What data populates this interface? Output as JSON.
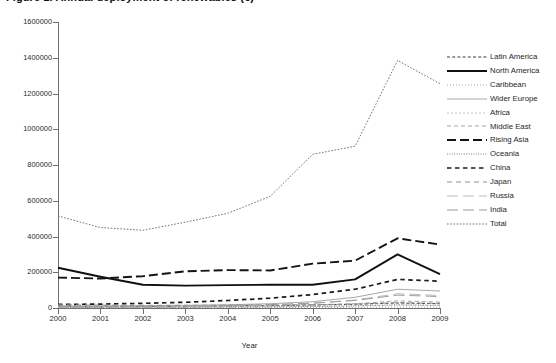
{
  "title": "Figure 1. Annual deployment of renewables (€)",
  "axis": {
    "x_title": "Year",
    "y_title": "",
    "x_ticks": [
      "2000",
      "2001",
      "2002",
      "2003",
      "2004",
      "2005",
      "2006",
      "2007",
      "2008",
      "2009"
    ],
    "y_ticks": [
      "0",
      "200000",
      "400000",
      "600000",
      "800000",
      "1000000",
      "1200000",
      "1400000",
      "1600000"
    ]
  },
  "legend": {
    "items": [
      {
        "label": "Latin America",
        "key": "dash-sparse-thin"
      },
      {
        "label": "North America",
        "key": "solid-thick"
      },
      {
        "label": "Caribbean",
        "key": "dot-fine"
      },
      {
        "label": "Wider Europe",
        "key": "solid-light"
      },
      {
        "label": "Africa",
        "key": "dash-fine-light"
      },
      {
        "label": "Middle East",
        "key": "dash-med-light"
      },
      {
        "label": "Rising Asia",
        "key": "dash-thick"
      },
      {
        "label": "Oceania",
        "key": "dot-dense"
      },
      {
        "label": "China",
        "key": "dash-square-bold"
      },
      {
        "label": "Japan",
        "key": "dash-med-gray"
      },
      {
        "label": "Russia",
        "key": "dash-long-light"
      },
      {
        "label": "India",
        "key": "dash-long-gray"
      },
      {
        "label": "Total",
        "key": "dot-thin"
      }
    ]
  },
  "chart_data": {
    "type": "line",
    "title": "Figure 1. Annual deployment of renewables (€)",
    "xlabel": "Year",
    "ylabel": "",
    "x": [
      2000,
      2001,
      2002,
      2003,
      2004,
      2005,
      2006,
      2007,
      2008,
      2009
    ],
    "xlim": [
      2000,
      2009
    ],
    "ylim": [
      0,
      1600000
    ],
    "ytick_step": 200000,
    "grid": false,
    "legend_position": "right",
    "series": [
      {
        "name": "Latin America",
        "values": [
          9000,
          9000,
          9000,
          10000,
          12000,
          14000,
          17000,
          21000,
          28000,
          24000
        ]
      },
      {
        "name": "North America",
        "values": [
          225000,
          175000,
          130000,
          125000,
          128000,
          130000,
          130000,
          160000,
          300000,
          190000
        ]
      },
      {
        "name": "Caribbean",
        "values": [
          2000,
          2000,
          2000,
          2000,
          2500,
          3000,
          3500,
          4000,
          5000,
          4500
        ]
      },
      {
        "name": "Wider Europe",
        "values": [
          12000,
          12000,
          13000,
          15000,
          18000,
          24000,
          35000,
          60000,
          105000,
          95000
        ]
      },
      {
        "name": "Africa",
        "values": [
          3000,
          3000,
          3000,
          4000,
          5000,
          6000,
          8000,
          11000,
          16000,
          14000
        ]
      },
      {
        "name": "Middle East",
        "values": [
          5000,
          5000,
          6000,
          7000,
          9000,
          12000,
          16000,
          24000,
          40000,
          33000
        ]
      },
      {
        "name": "Rising Asia",
        "values": [
          170000,
          165000,
          178000,
          205000,
          212000,
          210000,
          248000,
          265000,
          390000,
          355000
        ]
      },
      {
        "name": "Oceania",
        "values": [
          4000,
          4000,
          4500,
          5000,
          6000,
          7000,
          9000,
          12000,
          18000,
          15000
        ]
      },
      {
        "name": "China",
        "values": [
          20000,
          22000,
          26000,
          32000,
          42000,
          55000,
          75000,
          105000,
          160000,
          150000
        ]
      },
      {
        "name": "Japan",
        "values": [
          18000,
          16000,
          15000,
          15000,
          16000,
          17000,
          19000,
          22000,
          30000,
          26000
        ]
      },
      {
        "name": "Russia",
        "values": [
          6000,
          6000,
          7000,
          9000,
          12000,
          17000,
          26000,
          45000,
          80000,
          70000
        ]
      },
      {
        "name": "India",
        "values": [
          8000,
          8000,
          9000,
          11000,
          14000,
          19000,
          27000,
          42000,
          72000,
          64000
        ]
      },
      {
        "name": "Total",
        "values": [
          515000,
          450000,
          435000,
          480000,
          530000,
          625000,
          860000,
          905000,
          1385000,
          1255000
        ]
      }
    ]
  }
}
